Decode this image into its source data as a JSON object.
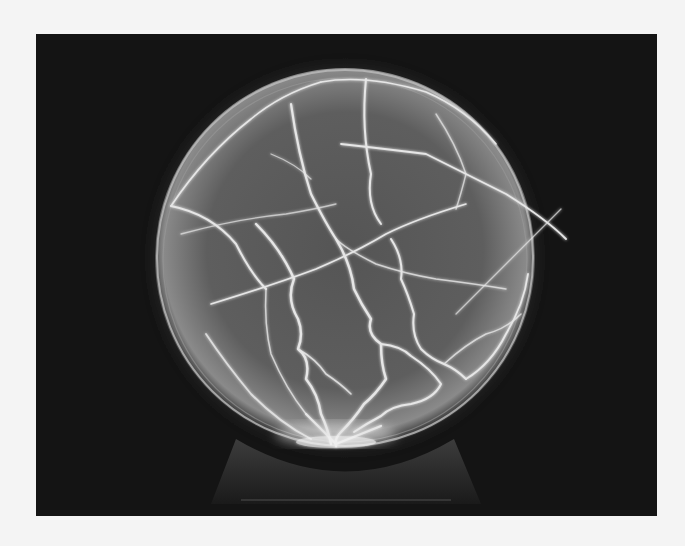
{
  "image": {
    "subject": "plasma ball",
    "description": "Black-and-white photograph of a glowing plasma globe with branching electrical filaments on a dark background",
    "caption": ""
  },
  "colors": {
    "page_background": "#f4f4f4",
    "photo_background": "#141414",
    "sphere_fill": "#5a5a5a",
    "filament": "#e8e8e8"
  }
}
